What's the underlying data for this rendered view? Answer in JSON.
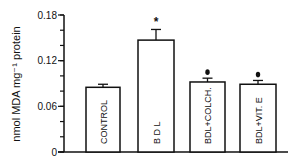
{
  "chart_data": {
    "type": "bar",
    "title": "",
    "xlabel": "",
    "ylabel": "nmol MDA mg⁻¹ protein",
    "ylim": [
      0,
      0.18
    ],
    "yticks": [
      0,
      0.06,
      0.12,
      0.18
    ],
    "ytick_labels": [
      "0",
      "0.06",
      "0.12",
      "0.18"
    ],
    "minor_tick_step": 0.02,
    "grid": false,
    "legend": null,
    "categories": [
      "CONTROL",
      "B D L",
      "BDL+COLCH.",
      "BDL+VIT. E"
    ],
    "values": [
      0.085,
      0.147,
      0.092,
      0.089
    ],
    "errors": [
      0.004,
      0.014,
      0.005,
      0.005
    ],
    "annotations": [
      "",
      "*",
      "●",
      "●"
    ],
    "bar_fill": "#ffffff",
    "bar_stroke": "#111111"
  }
}
